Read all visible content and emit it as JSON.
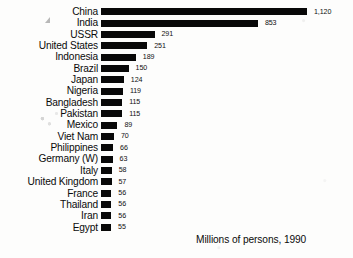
{
  "chart_data": {
    "type": "bar",
    "orientation": "horizontal",
    "title": "",
    "subtitle": "",
    "xlabel": "",
    "ylabel": "",
    "caption": "Millions of persons, 1990",
    "unit": "millions of persons",
    "year": "1990",
    "grid": false,
    "legend": false,
    "axis_visible": false,
    "value_labels": true,
    "xlim": [
      0,
      1120
    ],
    "bar_color": "#080808",
    "background_color": "#fdfdfc",
    "categories": [
      "China",
      "India",
      "USSR",
      "United States",
      "Indonesia",
      "Brazil",
      "Japan",
      "Nigeria",
      "Bangladesh",
      "Pakistan",
      "Mexico",
      "Viet Nam",
      "Philippines",
      "Germany (W)",
      "Italy",
      "United Kingdom",
      "France",
      "Thailand",
      "Iran",
      "Egypt"
    ],
    "values": [
      1120,
      853,
      291,
      251,
      189,
      150,
      124,
      119,
      115,
      115,
      89,
      70,
      66,
      63,
      58,
      57,
      56,
      56,
      56,
      55
    ],
    "value_labels_text": [
      "1,120",
      "853",
      "291",
      "251",
      "189",
      "150",
      "124",
      "119",
      "115",
      "115",
      "89",
      "70",
      "66",
      "63",
      "58",
      "57",
      "56",
      "56",
      "56",
      "55"
    ],
    "rows": [
      {
        "label": "China",
        "value": 1120,
        "display": "1,120"
      },
      {
        "label": "India",
        "value": 853,
        "display": "853"
      },
      {
        "label": "USSR",
        "value": 291,
        "display": "291"
      },
      {
        "label": "United States",
        "value": 251,
        "display": "251"
      },
      {
        "label": "Indonesia",
        "value": 189,
        "display": "189"
      },
      {
        "label": "Brazil",
        "value": 150,
        "display": "150"
      },
      {
        "label": "Japan",
        "value": 124,
        "display": "124"
      },
      {
        "label": "Nigeria",
        "value": 119,
        "display": "119"
      },
      {
        "label": "Bangladesh",
        "value": 115,
        "display": "115"
      },
      {
        "label": "Pakistan",
        "value": 115,
        "display": "115"
      },
      {
        "label": "Mexico",
        "value": 89,
        "display": "89"
      },
      {
        "label": "Viet Nam",
        "value": 70,
        "display": "70"
      },
      {
        "label": "Philippines",
        "value": 66,
        "display": "66"
      },
      {
        "label": "Germany (W)",
        "value": 63,
        "display": "63"
      },
      {
        "label": "Italy",
        "value": 58,
        "display": "58"
      },
      {
        "label": "United Kingdom",
        "value": 57,
        "display": "57"
      },
      {
        "label": "France",
        "value": 56,
        "display": "56"
      },
      {
        "label": "Thailand",
        "value": 56,
        "display": "56"
      },
      {
        "label": "Iran",
        "value": 56,
        "display": "56"
      },
      {
        "label": "Egypt",
        "value": 55,
        "display": "55"
      }
    ]
  }
}
